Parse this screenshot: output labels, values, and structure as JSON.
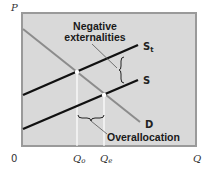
{
  "diagram": {
    "axes": {
      "y_label": "P",
      "x_label": "Q",
      "origin_label": "0"
    },
    "quantity_ticks": {
      "q0": {
        "base": "Q",
        "sub": "o"
      },
      "qe": {
        "base": "Q",
        "sub": "e"
      }
    },
    "curves": {
      "st": {
        "base": "S",
        "sub": "t"
      },
      "s": {
        "label": "S"
      },
      "d": {
        "label": "D"
      }
    },
    "annotations": {
      "negative_line1": "Negative",
      "negative_line2": "externalities",
      "overallocation": "Overallocation"
    },
    "colors": {
      "plot_background": "#d9d9d9",
      "frame": "#9a9a9a",
      "supply_lines": "#111111",
      "demand_line": "#8c8c8c",
      "guide_lines": "#ffffff"
    }
  }
}
